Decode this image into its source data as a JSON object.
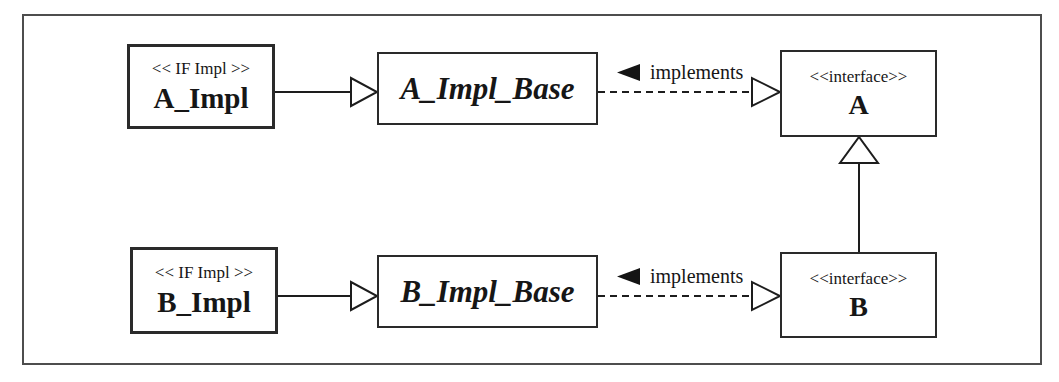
{
  "diagram": {
    "classes": {
      "a_impl": {
        "stereotype": "<< IF Impl >>",
        "name": "A_Impl"
      },
      "a_impl_base": {
        "name": "A_Impl_Base"
      },
      "a": {
        "stereotype": "<<interface>>",
        "name": "A"
      },
      "b_impl": {
        "stereotype": "<< IF Impl >>",
        "name": "B_Impl"
      },
      "b_impl_base": {
        "name": "B_Impl_Base"
      },
      "b": {
        "stereotype": "<<interface>>",
        "name": "B"
      }
    },
    "labels": {
      "implements_top": "implements",
      "implements_bottom": "implements"
    },
    "relationships": [
      {
        "from": "A_Impl",
        "to": "A_Impl_Base",
        "type": "generalization"
      },
      {
        "from": "A_Impl_Base",
        "to": "A",
        "type": "realization",
        "label": "implements"
      },
      {
        "from": "B_Impl",
        "to": "B_Impl_Base",
        "type": "generalization"
      },
      {
        "from": "B_Impl_Base",
        "to": "B",
        "type": "realization",
        "label": "implements"
      },
      {
        "from": "B",
        "to": "A",
        "type": "generalization"
      }
    ],
    "colors": {
      "line": "#1d1d1d",
      "box_border": "#2a2a2a",
      "frame_border": "#4d4d4d",
      "background": "#ffffff"
    }
  }
}
